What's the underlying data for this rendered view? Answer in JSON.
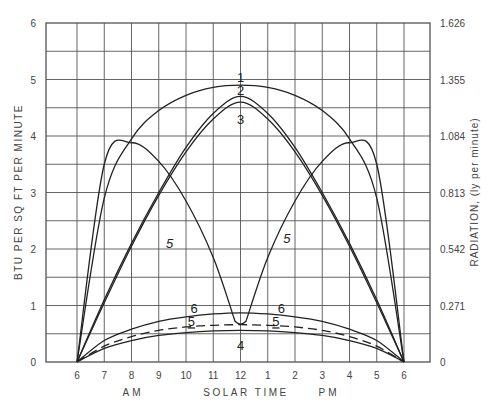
{
  "chart_data": {
    "type": "line",
    "title": "",
    "xlabel": "SOLAR TIME",
    "ylabel": "BTU PER SQ FT PER MINUTE",
    "ylabel_right": "RADIATION, (ly per minute)",
    "x_ticks": [
      "6",
      "7",
      "8",
      "9",
      "10",
      "11",
      "12",
      "1",
      "2",
      "3",
      "4",
      "5",
      "6"
    ],
    "x_period_labels": [
      "AM",
      "PM"
    ],
    "y_ticks": [
      "0",
      "1",
      "2",
      "3",
      "4",
      "5",
      "6"
    ],
    "y_ticks_right": [
      "0",
      "0.271",
      "0.542",
      "0.813",
      "1.084",
      "1.355",
      "1.626"
    ],
    "ylim": [
      0,
      6
    ],
    "xlim_hours": [
      6,
      18
    ],
    "grid": true,
    "x_hours": [
      6,
      7,
      8,
      9,
      10,
      11,
      12,
      13,
      14,
      15,
      16,
      17,
      18
    ],
    "series": [
      {
        "name": "1",
        "label_pos": [
          12,
          5.05
        ],
        "values": [
          0,
          2.9,
          3.95,
          4.45,
          4.72,
          4.86,
          4.9,
          4.86,
          4.72,
          4.45,
          3.95,
          2.9,
          0
        ]
      },
      {
        "name": "2",
        "label_pos": [
          12,
          4.82
        ],
        "values": [
          0,
          1.1,
          2.1,
          3.0,
          3.8,
          4.4,
          4.7,
          4.4,
          3.8,
          3.0,
          2.1,
          1.1,
          0
        ]
      },
      {
        "name": "3",
        "label_pos": [
          12,
          4.3
        ],
        "values": [
          0,
          1.05,
          2.05,
          2.95,
          3.72,
          4.3,
          4.6,
          4.3,
          3.72,
          2.95,
          2.05,
          1.05,
          0
        ]
      },
      {
        "name": "5",
        "label_pos": [
          [
            9.4,
            2.1
          ],
          [
            13.7,
            2.2
          ]
        ],
        "values": [
          0,
          3.5,
          3.88,
          3.55,
          2.85,
          1.85,
          0.7,
          1.85,
          2.85,
          3.55,
          3.88,
          3.5,
          0
        ]
      },
      {
        "name": "6",
        "label_pos": [
          [
            10.3,
            0.95
          ],
          [
            13.5,
            0.95
          ]
        ],
        "values": [
          0,
          0.38,
          0.58,
          0.72,
          0.8,
          0.85,
          0.87,
          0.85,
          0.8,
          0.72,
          0.58,
          0.38,
          0
        ]
      },
      {
        "name": "5 (dashed)",
        "label_pos": [
          [
            10.2,
            0.72
          ],
          [
            13.3,
            0.72
          ]
        ],
        "style": "dashed",
        "values": [
          0,
          0.28,
          0.45,
          0.56,
          0.62,
          0.65,
          0.66,
          0.65,
          0.62,
          0.56,
          0.45,
          0.28,
          0
        ]
      },
      {
        "name": "4",
        "label_pos": [
          12,
          0.3
        ],
        "values": [
          0,
          0.24,
          0.38,
          0.47,
          0.52,
          0.55,
          0.56,
          0.55,
          0.52,
          0.47,
          0.38,
          0.24,
          0
        ]
      }
    ]
  },
  "labels": {
    "ylabel": "BTU PER SQ FT PER MINUTE",
    "ylabel_right": "RADIATION, (ly per minute)",
    "xlabel": "SOLAR TIME",
    "am": "AM",
    "pm": "PM"
  }
}
